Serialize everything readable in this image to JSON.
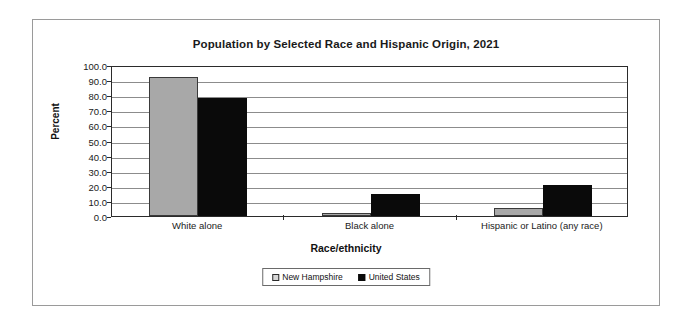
{
  "chart_data": {
    "type": "bar",
    "title": "Population by Selected Race and Hispanic Origin, 2021",
    "xlabel": "Race/ethnicity",
    "ylabel": "Percent",
    "ylim": [
      0,
      100
    ],
    "ytick_step": 10,
    "ytick_labels": [
      "0.0",
      "10.0",
      "20.0",
      "30.0",
      "40.0",
      "50.0",
      "60.0",
      "70.0",
      "80.0",
      "90.0",
      "100.0"
    ],
    "grid": true,
    "legend_position": "bottom",
    "categories": [
      "White alone",
      "Black alone",
      "Hispanic or Latino (any race)"
    ],
    "series": [
      {
        "name": "New Hampshire",
        "color": "#a8a8a8",
        "values": [
          92.0,
          2.0,
          5.0
        ]
      },
      {
        "name": "United States",
        "color": "#0a0a0a",
        "values": [
          78.0,
          14.5,
          20.5
        ]
      }
    ]
  },
  "legend": {
    "items": [
      {
        "label": "New Hampshire",
        "swatch": "legend-swatch-new-hampshire"
      },
      {
        "label": "United States",
        "swatch": "legend-swatch-united-states"
      }
    ]
  }
}
